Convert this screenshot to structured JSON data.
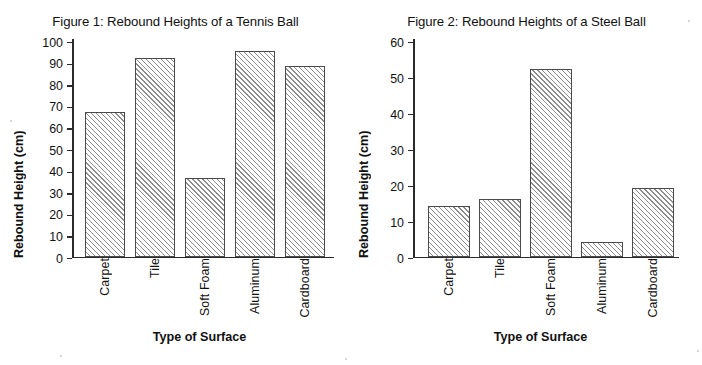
{
  "figures": [
    {
      "title": "Figure 1: Rebound Heights of a Tennis Ball",
      "ylabel": "Rebound Height (cm)",
      "xlabel": "Type of Surface",
      "yticks": [
        "100",
        "90",
        "80",
        "70",
        "60",
        "50",
        "40",
        "30",
        "20",
        "10",
        "0"
      ],
      "categories": [
        "Carpet",
        "Tile",
        "Soft Foam",
        "Aluminum",
        "Cardboard"
      ]
    },
    {
      "title": "Figure 2: Rebound Heights of a Steel Ball",
      "ylabel": "Rebound Height (cm)",
      "xlabel": "Type of Surface",
      "yticks": [
        "60",
        "50",
        "40",
        "30",
        "20",
        "10",
        "0"
      ],
      "categories": [
        "Carpet",
        "Tile",
        "Soft Foam",
        "Aluminum",
        "Cardboard"
      ]
    }
  ],
  "chart_data": [
    {
      "type": "bar",
      "title": "Figure 1: Rebound Heights of a Tennis Ball",
      "xlabel": "Type of Surface",
      "ylabel": "Rebound Height (cm)",
      "categories": [
        "Carpet",
        "Tile",
        "Soft Foam",
        "Aluminum",
        "Cardboard"
      ],
      "values": [
        67,
        92,
        36.5,
        95,
        88
      ],
      "ylim": [
        0,
        100
      ],
      "ytick_step": 10,
      "grid": false,
      "legend": null,
      "bar_fill": "diagonal-hatch"
    },
    {
      "type": "bar",
      "title": "Figure 2: Rebound Heights of a Steel Ball",
      "xlabel": "Type of Surface",
      "ylabel": "Rebound Height (cm)",
      "categories": [
        "Carpet",
        "Tile",
        "Soft Foam",
        "Aluminum",
        "Cardboard"
      ],
      "values": [
        14,
        16,
        52,
        4,
        19
      ],
      "ylim": [
        0,
        60
      ],
      "ytick_step": 10,
      "grid": false,
      "legend": null,
      "bar_fill": "diagonal-hatch"
    }
  ]
}
